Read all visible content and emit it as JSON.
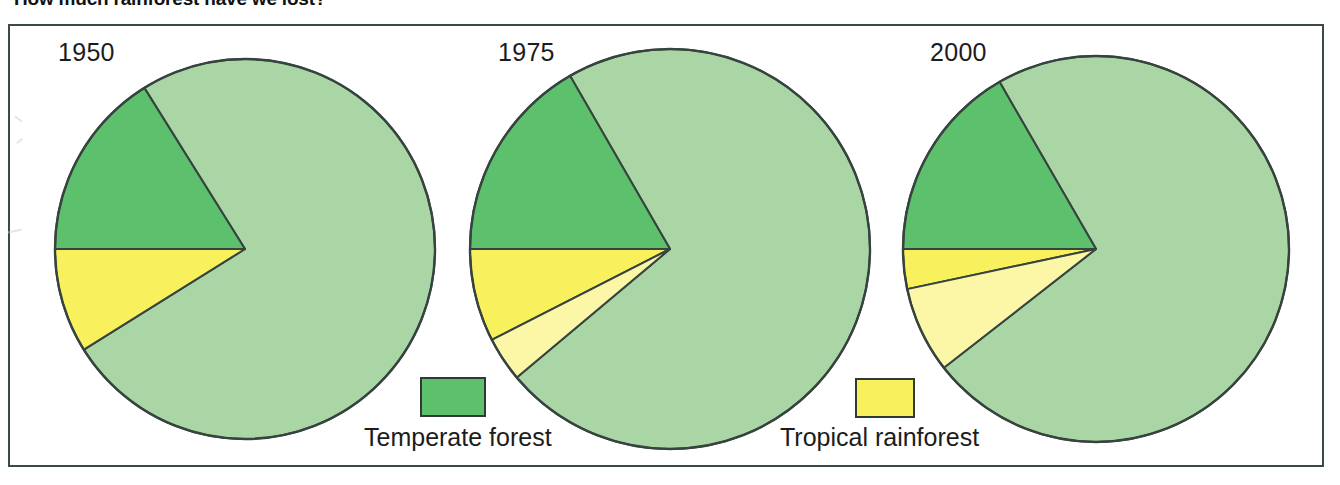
{
  "figure": {
    "title": "How much rainforest have we lost?",
    "frame_border_color": "#3a4a46"
  },
  "legend": {
    "items": [
      {
        "name": "temperate-forest",
        "label": "Temperate forest",
        "color": "#5cc06c",
        "swatch": "green-square-swatch"
      },
      {
        "name": "tropical-rainforest",
        "label": "Tropical rainforest",
        "color": "#f9f05e",
        "swatch": "yellow-square-swatch"
      }
    ]
  },
  "colors": {
    "light_green": "#a9d6a4",
    "dark_green": "#5cc06c",
    "bright_yellow": "#f9f05e",
    "pale_yellow": "#fbf7a6",
    "outline": "#36433f",
    "background": "#ffffff"
  },
  "chart_data": {
    "type": "pie",
    "title": "How much rainforest have we lost?",
    "legend_position": "between-pies-bottom",
    "series_labels": [
      "Remaining land",
      "Temperate forest",
      "Tropical rainforest",
      "Rainforest lost"
    ],
    "charts": [
      {
        "year": "1950",
        "center": [
          245,
          249
        ],
        "radius": 190,
        "slices": [
          {
            "label": "Remaining land",
            "category": "other",
            "color": "#a9d6a4",
            "percent": 68,
            "start_deg": 238,
            "end_deg": 148
          },
          {
            "label": "Temperate forest",
            "category": "temperate-forest",
            "color": "#5cc06c",
            "percent": 16,
            "start_deg": 180,
            "end_deg": 238
          },
          {
            "label": "Tropical rainforest",
            "category": "tropical-rainforest",
            "color": "#f9f05e",
            "percent": 16,
            "start_deg": 148,
            "end_deg": 180
          }
        ]
      },
      {
        "year": "1975",
        "center": [
          670,
          249
        ],
        "radius": 200,
        "slices": [
          {
            "label": "Remaining land",
            "category": "other",
            "color": "#a9d6a4",
            "percent": 63,
            "start_deg": 240,
            "end_deg": 140
          },
          {
            "label": "Temperate forest",
            "category": "temperate-forest",
            "color": "#5cc06c",
            "percent": 17,
            "start_deg": 180,
            "end_deg": 240
          },
          {
            "label": "Tropical rainforest",
            "category": "tropical-rainforest",
            "color": "#f9f05e",
            "percent": 13,
            "start_deg": 153,
            "end_deg": 180
          },
          {
            "label": "Rainforest lost",
            "category": "rainforest-lost",
            "color": "#fbf7a6",
            "percent": 7,
            "start_deg": 140,
            "end_deg": 153
          }
        ]
      },
      {
        "year": "2000",
        "center": [
          1096,
          249
        ],
        "radius": 193,
        "slices": [
          {
            "label": "Remaining land",
            "category": "other",
            "color": "#a9d6a4",
            "percent": 62,
            "start_deg": 240,
            "end_deg": 142
          },
          {
            "label": "Temperate forest",
            "category": "temperate-forest",
            "color": "#5cc06c",
            "percent": 17,
            "start_deg": 180,
            "end_deg": 240
          },
          {
            "label": "Tropical rainforest",
            "category": "tropical-rainforest",
            "color": "#f9f05e",
            "percent": 5,
            "start_deg": 168,
            "end_deg": 180
          },
          {
            "label": "Rainforest lost",
            "category": "rainforest-lost",
            "color": "#fbf7a6",
            "percent": 16,
            "start_deg": 142,
            "end_deg": 168
          }
        ]
      }
    ]
  }
}
